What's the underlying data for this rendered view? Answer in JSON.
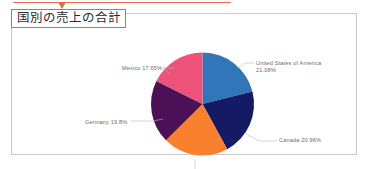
{
  "annotation": {
    "name": "red-callout-arrow",
    "color": "#e8603c"
  },
  "card": {
    "border_color": "#c9c9c9",
    "background": "#ffffff"
  },
  "title": {
    "text": "国別の売上の合計",
    "highlight_color": "#e8603c"
  },
  "chart_data": {
    "type": "pie",
    "title": "国別の売上の合計",
    "xlabel": "",
    "ylabel": "",
    "legend_position": "none",
    "label_format": "{name} {value}%",
    "categories": [
      "United States of America",
      "Canada",
      "France",
      "Germany",
      "Mexico"
    ],
    "values": [
      21.08,
      20.96,
      20.51,
      19.8,
      17.65
    ],
    "colors": [
      "#3076b8",
      "#141a63",
      "#f9802f",
      "#4b1055",
      "#ec527a"
    ],
    "labels": [
      "United States of America\n21.08%",
      "Canada 20.96%",
      "France 20.51%",
      "Germany 19.8%",
      "Mexico 17.65%"
    ],
    "slices": [
      {
        "name": "United States of America",
        "value": 21.08,
        "display": "United States of America\n21.08%",
        "color": "#3076b8"
      },
      {
        "name": "Canada",
        "value": 20.96,
        "display": "Canada 20.96%",
        "color": "#141a63"
      },
      {
        "name": "France",
        "value": 20.51,
        "display": "France 20.51%",
        "color": "#f9802f"
      },
      {
        "name": "Germany",
        "value": 19.8,
        "display": "Germany 19.8%",
        "color": "#4b1055"
      },
      {
        "name": "Mexico",
        "value": 17.65,
        "display": "Mexico 17.65%",
        "color": "#ec527a"
      }
    ]
  }
}
